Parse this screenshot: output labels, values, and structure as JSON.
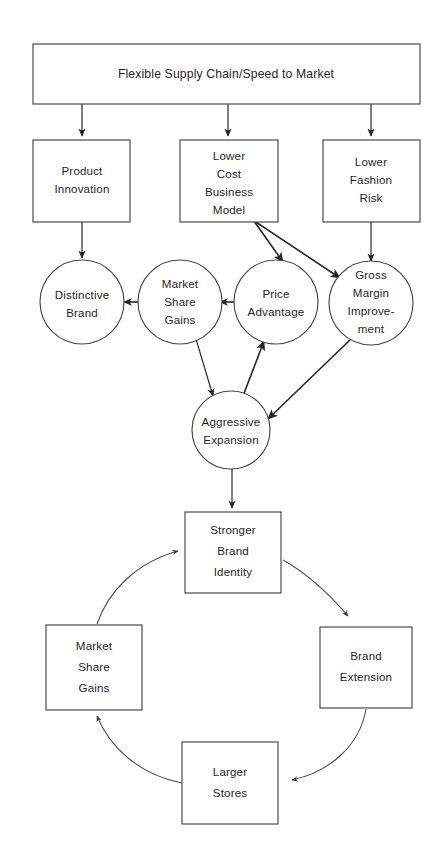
{
  "diagram": {
    "colors": {
      "background": "#ffffff",
      "node_fill": "#ffffff",
      "node_stroke": "#454545",
      "edge_stroke": "#333333",
      "text": "#1f1f1f"
    },
    "nodes": {
      "flexible_supply_chain": {
        "label": "Flexible Supply Chain/Speed to Market",
        "shape": "rect"
      },
      "product_innovation": {
        "line1": "Product",
        "line2": "Innovation",
        "shape": "rect"
      },
      "lower_cost_business_model": {
        "line1": "Lower",
        "line2": "Cost",
        "line3": "Business",
        "line4": "Model",
        "shape": "rect"
      },
      "lower_fashion_risk": {
        "line1": "Lower",
        "line2": "Fashion",
        "line3": "Risk",
        "shape": "rect"
      },
      "distinctive_brand": {
        "line1": "Distinctive",
        "line2": "Brand",
        "shape": "circle"
      },
      "market_share_gains_circle": {
        "line1": "Market",
        "line2": "Share",
        "line3": "Gains",
        "shape": "circle"
      },
      "price_advantage": {
        "line1": "Price",
        "line2": "Advantage",
        "shape": "circle"
      },
      "gross_margin_improvement": {
        "line1": "Gross",
        "line2": "Margin",
        "line3": "Improve-",
        "line4": "ment",
        "shape": "circle"
      },
      "aggressive_expansion": {
        "line1": "Aggressive",
        "line2": "Expansion",
        "shape": "circle"
      },
      "stronger_brand_identity": {
        "line1": "Stronger",
        "line2": "Brand",
        "line3": "Identity",
        "shape": "rect"
      },
      "market_share_gains_box": {
        "line1": "Market",
        "line2": "Share",
        "line3": "Gains",
        "shape": "rect"
      },
      "brand_extension": {
        "line1": "Brand",
        "line2": "Extension",
        "shape": "rect"
      },
      "larger_stores": {
        "line1": "Larger",
        "line2": "Stores",
        "shape": "rect"
      }
    },
    "edges": [
      {
        "from": "flexible_supply_chain",
        "to": "product_innovation",
        "style": "straight"
      },
      {
        "from": "flexible_supply_chain",
        "to": "lower_cost_business_model",
        "style": "straight"
      },
      {
        "from": "flexible_supply_chain",
        "to": "lower_fashion_risk",
        "style": "straight"
      },
      {
        "from": "product_innovation",
        "to": "distinctive_brand",
        "style": "straight"
      },
      {
        "from": "lower_cost_business_model",
        "to": "price_advantage",
        "style": "straight"
      },
      {
        "from": "lower_cost_business_model",
        "to": "gross_margin_improvement",
        "style": "straight"
      },
      {
        "from": "lower_fashion_risk",
        "to": "gross_margin_improvement",
        "style": "straight"
      },
      {
        "from": "market_share_gains_circle",
        "to": "distinctive_brand",
        "style": "straight"
      },
      {
        "from": "price_advantage",
        "to": "market_share_gains_circle",
        "style": "straight"
      },
      {
        "from": "market_share_gains_circle",
        "to": "aggressive_expansion",
        "style": "straight"
      },
      {
        "from": "aggressive_expansion",
        "to": "price_advantage",
        "style": "straight"
      },
      {
        "from": "gross_margin_improvement",
        "to": "aggressive_expansion",
        "style": "straight"
      },
      {
        "from": "aggressive_expansion",
        "to": "stronger_brand_identity",
        "style": "straight"
      },
      {
        "from": "stronger_brand_identity",
        "to": "brand_extension",
        "style": "curved"
      },
      {
        "from": "brand_extension",
        "to": "larger_stores",
        "style": "curved"
      },
      {
        "from": "larger_stores",
        "to": "market_share_gains_box",
        "style": "curved"
      },
      {
        "from": "market_share_gains_box",
        "to": "stronger_brand_identity",
        "style": "curved"
      }
    ]
  }
}
